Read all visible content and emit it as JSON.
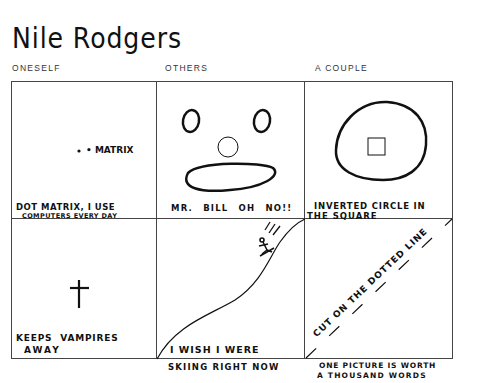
{
  "title": "Nile Rodgers",
  "columns": [
    {
      "label": "ONESELF"
    },
    {
      "label": "OTHERS"
    },
    {
      "label": "A COUPLE"
    }
  ],
  "cells": [
    {
      "row": 1,
      "col": 1,
      "drawing": "dot-with-label",
      "inner_label": "• MATRIX",
      "caption_line1": "DOT MATRIX, I USE",
      "caption_line2": "COMPUTERS EVERY DAY"
    },
    {
      "row": 1,
      "col": 2,
      "drawing": "mr-bill-face",
      "caption_line1": "MR. BILL OH NO!!"
    },
    {
      "row": 1,
      "col": 3,
      "drawing": "square-in-circle",
      "caption_line1": "INVERTED CIRCLE IN",
      "caption_line2": "THE SQUARE"
    },
    {
      "row": 2,
      "col": 1,
      "drawing": "cross",
      "caption_line1": "KEEPS VAMPIRES",
      "caption_line2": "AWAY"
    },
    {
      "row": 2,
      "col": 2,
      "drawing": "skier-on-slope",
      "caption_line1": "I WISH I WERE",
      "caption_line2": "SKIING RIGHT NOW"
    },
    {
      "row": 2,
      "col": 3,
      "drawing": "diagonal-dotted-line",
      "diagonal_text": "CUT ON THE DOTTED LINE",
      "caption_line1": "ONE PICTURE IS WORTH",
      "caption_line2": "A THOUSAND WORDS"
    }
  ]
}
